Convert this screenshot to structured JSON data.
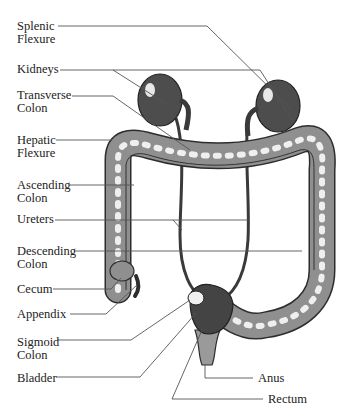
{
  "diagram": {
    "title": "",
    "labels": [
      {
        "id": "splenic-flexure",
        "text": "Splenic\nFlexure",
        "x": 17,
        "y": 20
      },
      {
        "id": "kidneys",
        "text": "Kidneys",
        "x": 17,
        "y": 63
      },
      {
        "id": "transverse-colon",
        "text": "Transverse\nColon",
        "x": 17,
        "y": 89
      },
      {
        "id": "hepatic-flexure",
        "text": "Hepatic\nFlexure",
        "x": 17,
        "y": 134
      },
      {
        "id": "ascending-colon",
        "text": "Ascending\nColon",
        "x": 17,
        "y": 179
      },
      {
        "id": "ureters",
        "text": "Ureters",
        "x": 17,
        "y": 213
      },
      {
        "id": "descending-colon",
        "text": "Descending\nColon",
        "x": 17,
        "y": 245
      },
      {
        "id": "cecum",
        "text": "Cecum",
        "x": 17,
        "y": 283
      },
      {
        "id": "appendix",
        "text": "Appendix",
        "x": 17,
        "y": 308
      },
      {
        "id": "sigmoid-colon",
        "text": "Sigmoid\nColon",
        "x": 17,
        "y": 336
      },
      {
        "id": "bladder",
        "text": "Bladder",
        "x": 17,
        "y": 373
      },
      {
        "id": "anus",
        "text": "Anus",
        "x": 258,
        "y": 374
      },
      {
        "id": "rectum",
        "text": "Rectum",
        "x": 268,
        "y": 396
      }
    ],
    "leader_lines": [
      {
        "for": "splenic-flexure",
        "points": "58,26 207,26 292,110"
      },
      {
        "for": "kidneys",
        "points": "60,70 113,70 165,103 M198,70 197,70 260,70 317,117"
      },
      {
        "for": "transverse-colon",
        "points": "72,96 113,96 190,150"
      },
      {
        "for": "hepatic-flexure",
        "points": "56,140 112,140"
      },
      {
        "for": "ascending-colon",
        "points": "69,185 134,185"
      },
      {
        "for": "ureters",
        "points": "55,220 270,220 M173,220 182,230"
      },
      {
        "for": "descending-colon",
        "points": "74,251 302,251"
      },
      {
        "for": "cecum",
        "points": "53,289 111,289 121,278"
      },
      {
        "for": "appendix",
        "points": "70,314 106,314 137,285"
      },
      {
        "for": "sigmoid-colon",
        "points": "57,340 131,340 190,300"
      },
      {
        "for": "bladder",
        "points": "56,377 140,377 196,313"
      },
      {
        "for": "anus",
        "points": "253,378 205,378 205,364"
      },
      {
        "for": "rectum",
        "points": "263,399 172,399 172,387 202,330"
      }
    ]
  },
  "colors": {
    "background": "#ffffff",
    "text": "#222222",
    "lines": "#555555",
    "organ_dark": "#4a4a4a",
    "colon_mid": "#8c8c8c",
    "highlight": "#f2f2f2"
  }
}
